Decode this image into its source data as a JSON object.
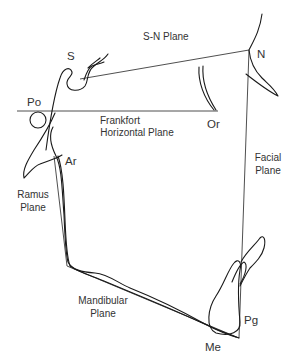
{
  "diagram": {
    "landmarks": {
      "S": "S",
      "N": "N",
      "Po": "Po",
      "Or": "Or",
      "Ar": "Ar",
      "Pg": "Pg",
      "Me": "Me"
    },
    "planes": {
      "sn": [
        "S-N Plane"
      ],
      "frankfort": [
        "Frankfort",
        "Horizontal Plane"
      ],
      "facial": [
        "Facial",
        "Plane"
      ],
      "ramus": [
        "Ramus",
        "Plane"
      ],
      "mandibular": [
        "Mandibular",
        "Plane"
      ]
    },
    "colors": {
      "line": "#222222",
      "text": "#333333",
      "background": "#ffffff"
    }
  }
}
